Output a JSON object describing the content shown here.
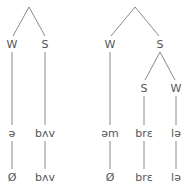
{
  "diagram": {
    "line_color": "#8a8a8a",
    "text_color": "#555555",
    "trees": [
      {
        "id": "left",
        "nodes": [
          {
            "id": "L-W",
            "label": "W",
            "x": 12,
            "y": 44
          },
          {
            "id": "L-S",
            "label": "S",
            "x": 45,
            "y": 44
          }
        ],
        "underlying": [
          {
            "label": "ə",
            "x": 12,
            "y": 133
          },
          {
            "label": "bʌv",
            "x": 45,
            "y": 133
          }
        ],
        "surface": [
          {
            "label": "Ø",
            "x": 12,
            "y": 177
          },
          {
            "label": "bʌv",
            "x": 45,
            "y": 177
          }
        ]
      },
      {
        "id": "right",
        "nodes": [
          {
            "id": "R-W",
            "label": "W",
            "x": 110,
            "y": 44
          },
          {
            "id": "R-S",
            "label": "S",
            "x": 160,
            "y": 44
          },
          {
            "id": "R-S-S",
            "label": "S",
            "x": 144,
            "y": 88
          },
          {
            "id": "R-S-W",
            "label": "W",
            "x": 176,
            "y": 88
          }
        ],
        "underlying": [
          {
            "label": "əm",
            "x": 110,
            "y": 133
          },
          {
            "label": "brɛ",
            "x": 144,
            "y": 133
          },
          {
            "label": "lə",
            "x": 176,
            "y": 133
          }
        ],
        "surface": [
          {
            "label": "Ø",
            "x": 110,
            "y": 177
          },
          {
            "label": "brɛ",
            "x": 144,
            "y": 177
          },
          {
            "label": "lə",
            "x": 176,
            "y": 177
          }
        ]
      }
    ]
  }
}
